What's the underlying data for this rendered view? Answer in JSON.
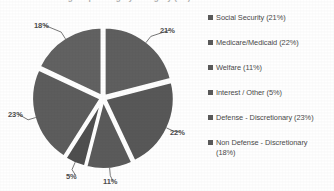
{
  "chart_data": {
    "type": "pie",
    "title": "Federal Budget Spending by Category (FY)",
    "categories": [
      "Social Security",
      "Medicare/Medicaid",
      "Welfare",
      "Interest / Other",
      "Defense - Discretionary",
      "Non Defense - Discretionary"
    ],
    "values": [
      21,
      22,
      11,
      5,
      23,
      18
    ],
    "unit": "%",
    "legend_position": "right",
    "grid": false,
    "xlabel": "",
    "ylabel": "",
    "slice_colors": [
      "#5f5f5f",
      "#585858",
      "#5b5b5b",
      "#4f4f4f",
      "#5d5d5d",
      "#626262"
    ],
    "exploded": true,
    "start_angle_deg": 0,
    "direction": "clockwise"
  },
  "title": {
    "text": "Federal Budget Spending by Category (FY)"
  },
  "pie": {
    "labels": [
      {
        "text": "21%",
        "left": 160,
        "top": 26
      },
      {
        "text": "22%",
        "left": 170,
        "top": 128
      },
      {
        "text": "11%",
        "left": 103,
        "top": 177
      },
      {
        "text": "5%",
        "left": 66,
        "top": 172
      },
      {
        "text": "23%",
        "left": 8,
        "top": 110
      },
      {
        "text": "18%",
        "left": 34,
        "top": 21
      }
    ]
  },
  "legend": {
    "items": [
      {
        "label": "Social Security (21%)",
        "color": "#5a5a5a",
        "top": 3
      },
      {
        "label": "Medicare/Medicaid (22%)",
        "color": "#5a5a5a",
        "top": 28
      },
      {
        "label": "Welfare (11%)",
        "color": "#5a5a5a",
        "top": 53
      },
      {
        "label": "Interest / Other (5%)",
        "color": "#5a5a5a",
        "top": 78
      },
      {
        "label": "Defense - Discretionary (23%)",
        "color": "#5a5a5a",
        "top": 103
      },
      {
        "label": "Non Defense - Discretionary\n(18%)",
        "color": "#5a5a5a",
        "top": 128
      }
    ]
  },
  "colors": {
    "background": "#ffffff",
    "slice_fill": "#5b5b5b",
    "slice_gap": "#ffffff",
    "label_text": "#4d4d4d",
    "legend_text": "#4a4a4a"
  }
}
